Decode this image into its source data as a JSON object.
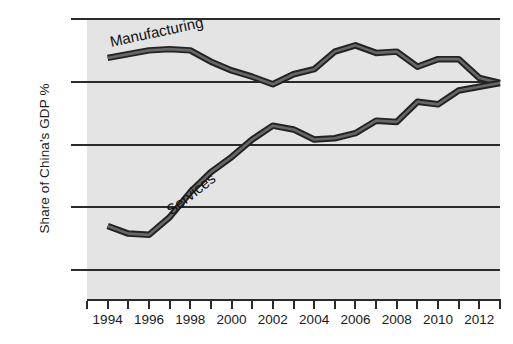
{
  "chart_data": {
    "type": "line",
    "title": "",
    "xlabel": "",
    "ylabel": "Share of China's GDP %",
    "xlim": [
      1993,
      2013
    ],
    "ylim": [
      27.66,
      50
    ],
    "grid": true,
    "legend_position": "inline-series-labels",
    "yticks": [
      30,
      35,
      40,
      45,
      50
    ],
    "ytick_labels": [
      "30%",
      "35%",
      "40%",
      "45%",
      "50%"
    ],
    "xticks": [
      1993,
      1994,
      1995,
      1996,
      1997,
      1998,
      1999,
      2000,
      2001,
      2002,
      2003,
      2004,
      2005,
      2006,
      2007,
      2008,
      2009,
      2010,
      2011,
      2012,
      2013
    ],
    "xtick_labels": [
      "1994",
      "1996",
      "1998",
      "2000",
      "2002",
      "2004",
      "2006",
      "2008",
      "2010",
      "2012"
    ],
    "xtick_labeled_years": [
      1994,
      1996,
      1998,
      2000,
      2002,
      2004,
      2006,
      2008,
      2010,
      2012
    ],
    "x": [
      1994,
      1995,
      1996,
      1997,
      1998,
      1999,
      2000,
      2001,
      2002,
      2003,
      2004,
      2005,
      2006,
      2007,
      2008,
      2009,
      2010,
      2011,
      2012,
      2013
    ],
    "series": [
      {
        "name": "Manufacturing",
        "color": "#3a3a3a",
        "values": [
          46.9,
          47.2,
          47.5,
          47.6,
          47.5,
          46.6,
          45.9,
          45.4,
          44.8,
          45.6,
          46.0,
          47.4,
          47.9,
          47.3,
          47.4,
          46.2,
          46.8,
          46.8,
          45.3,
          44.9
        ]
      },
      {
        "name": "Services",
        "color": "#3a3a3a",
        "values": [
          33.5,
          32.9,
          32.8,
          34.2,
          36.2,
          37.8,
          39.0,
          40.4,
          41.5,
          41.2,
          40.4,
          40.5,
          40.9,
          41.9,
          41.8,
          43.4,
          43.2,
          44.3,
          44.6,
          44.9
        ]
      }
    ],
    "background_color": "#e4e4e4",
    "axis_color": "#2b2b2b",
    "page_background": "#ffffff"
  }
}
